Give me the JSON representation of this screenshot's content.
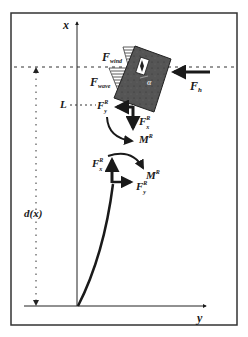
{
  "figure": {
    "type": "free-body diagram",
    "axes": {
      "vertical_label": "x",
      "horizontal_label": "y"
    },
    "labels": {
      "wind_force": {
        "main": "F",
        "sub": "wind"
      },
      "wave_force": {
        "main": "F",
        "sub": "wave"
      },
      "hawser_force": {
        "main": "F",
        "sub": "h"
      },
      "angle": "α",
      "length_marker": "L",
      "depth_function": "d(x)",
      "top_joint": {
        "force_y": {
          "main": "F",
          "sup": "R",
          "sub": "y"
        },
        "force_x": {
          "main": "F",
          "sup": "R",
          "sub": "x"
        },
        "moment": {
          "main": "M",
          "sup": "R"
        }
      },
      "bottom_joint": {
        "force_x": {
          "main": "F",
          "sup": "R",
          "sub": "x"
        },
        "force_y": {
          "main": "F",
          "sup": "R",
          "sub": "y"
        },
        "moment": {
          "main": "M",
          "sup": "R"
        }
      }
    },
    "colors": {
      "ink": "#1a1a1a",
      "vessel_fill": "#555555",
      "frame": "#333333"
    }
  }
}
